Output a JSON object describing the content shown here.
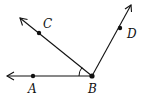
{
  "diagram": {
    "type": "geometry-angles",
    "vertex": {
      "label": "B",
      "x": 92,
      "y": 76
    },
    "rays": [
      {
        "name": "ray-BA",
        "point_label": "A",
        "point": [
          33,
          76
        ],
        "arrow_tip": [
          7,
          76
        ]
      },
      {
        "name": "ray-BC",
        "point_label": "C",
        "point": [
          39,
          33
        ],
        "arrow_tip": [
          20,
          18
        ]
      },
      {
        "name": "ray-BD",
        "point_label": "D",
        "point": [
          120,
          28
        ],
        "arrow_tip": [
          131,
          5
        ]
      }
    ],
    "angle_mark": {
      "between": [
        "BA",
        "BC"
      ],
      "vertex": "B"
    },
    "labels": {
      "A": "A",
      "B": "B",
      "C": "C",
      "D": "D"
    },
    "colors": {
      "stroke": "#111111",
      "background": "#ffffff"
    }
  }
}
